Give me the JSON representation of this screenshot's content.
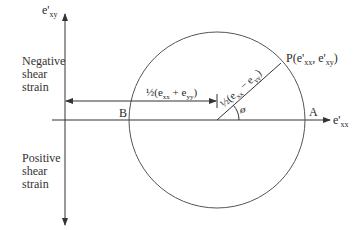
{
  "axes": {
    "vertical_label_base": "e'",
    "vertical_label_sub": "xy",
    "horizontal_label_base": "e'",
    "horizontal_label_sub": "xx"
  },
  "regions": {
    "upper": [
      "Negative",
      "shear",
      "strain"
    ],
    "lower": [
      "Positive",
      "shear",
      "strain"
    ]
  },
  "points": {
    "A": "A",
    "B": "B",
    "P": {
      "prefix": "P(e'",
      "sub1": "xx",
      "mid": ", e'",
      "sub2": "xy",
      "suffix": ")"
    }
  },
  "dimensions": {
    "center_offset": {
      "fraction": "½",
      "open": "(e",
      "sub1": "xx",
      "op": " + e",
      "sub2": "yy",
      "close": ")"
    },
    "radius": {
      "fraction": "½",
      "open": "(e",
      "sub1": "xx",
      "op": " − e",
      "sub2": "yy",
      "close": ")"
    }
  },
  "angle": {
    "symbol": "ø"
  },
  "colors": {
    "line": "#333333",
    "circle": "#555555"
  }
}
